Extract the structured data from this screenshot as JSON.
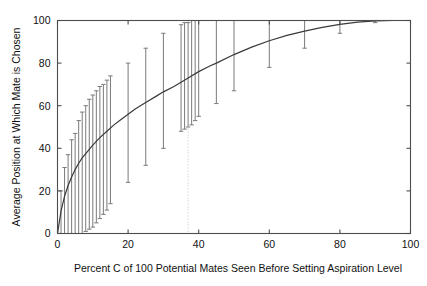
{
  "chart_data": {
    "type": "line",
    "title": "",
    "subtitle": "",
    "xlabel": "Percent C of 100 Potential Mates Seen Before Setting Aspiration Level",
    "ylabel": "Average Position at Which Mate is Chosen",
    "xlim": [
      0,
      100
    ],
    "ylim": [
      0,
      100
    ],
    "xticks": [
      0,
      20,
      40,
      60,
      80,
      100
    ],
    "yticks": [
      0,
      20,
      40,
      60,
      80,
      100
    ],
    "xtick_labels": [
      "0",
      "20",
      "40",
      "60",
      "80",
      "100"
    ],
    "ytick_labels": [
      "0",
      "20",
      "40",
      "60",
      "80",
      "100"
    ],
    "grid": false,
    "legend": null,
    "legend_position": "none",
    "frame": "box-all-sides-with-ticks",
    "annotations": [
      {
        "name": "optimal-aspiration-reference",
        "type": "vertical-dotted-line",
        "x": 37,
        "style": "dotted",
        "color": "#bdbdbd"
      }
    ],
    "series": [
      {
        "name": "mean-average-position",
        "style": "solid-curve",
        "color": "#3a3a3a",
        "x": [
          0,
          1,
          2,
          3,
          4,
          5,
          6,
          7,
          8,
          9,
          10,
          12,
          14,
          16,
          18,
          20,
          22,
          25,
          28,
          30,
          33,
          35,
          37,
          40,
          43,
          45,
          50,
          55,
          60,
          65,
          70,
          75,
          80,
          85,
          90,
          95,
          100
        ],
        "y": [
          0,
          10.5,
          17.5,
          22.5,
          26.5,
          30.0,
          33.0,
          35.5,
          37.5,
          39.5,
          41.5,
          45.0,
          48.0,
          51.0,
          53.5,
          56.0,
          58.5,
          61.5,
          64.5,
          66.5,
          69.0,
          71.0,
          73.0,
          76.0,
          78.5,
          80.0,
          84.0,
          87.5,
          90.5,
          93.0,
          95.0,
          96.8,
          98.2,
          99.2,
          99.8,
          100.0,
          100.0
        ]
      }
    ],
    "error_bars": {
      "name": "variability-range-bars",
      "color": "#7a7a7a",
      "orientation": "vertical",
      "caps": true,
      "points": [
        {
          "x": 1,
          "low": 0,
          "high": 20
        },
        {
          "x": 2,
          "low": 0,
          "high": 31
        },
        {
          "x": 3,
          "low": 0,
          "high": 37
        },
        {
          "x": 4,
          "low": 0,
          "high": 44
        },
        {
          "x": 5,
          "low": 0,
          "high": 47
        },
        {
          "x": 6,
          "low": 0,
          "high": 53
        },
        {
          "x": 7,
          "low": 0,
          "high": 57
        },
        {
          "x": 8,
          "low": 1,
          "high": 60
        },
        {
          "x": 9,
          "low": 2,
          "high": 63
        },
        {
          "x": 10,
          "low": 3,
          "high": 65
        },
        {
          "x": 11,
          "low": 5,
          "high": 67
        },
        {
          "x": 12,
          "low": 7,
          "high": 69
        },
        {
          "x": 13,
          "low": 9,
          "high": 70
        },
        {
          "x": 14,
          "low": 11,
          "high": 72
        },
        {
          "x": 15,
          "low": 14,
          "high": 74
        },
        {
          "x": 20,
          "low": 24,
          "high": 80
        },
        {
          "x": 25,
          "low": 32,
          "high": 87
        },
        {
          "x": 30,
          "low": 40,
          "high": 94
        },
        {
          "x": 35,
          "low": 48,
          "high": 98
        },
        {
          "x": 36,
          "low": 49,
          "high": 99
        },
        {
          "x": 37,
          "low": 50,
          "high": 99
        },
        {
          "x": 38,
          "low": 51,
          "high": 100
        },
        {
          "x": 39,
          "low": 53,
          "high": 100
        },
        {
          "x": 40,
          "low": 55,
          "high": 100
        },
        {
          "x": 45,
          "low": 61,
          "high": 100
        },
        {
          "x": 50,
          "low": 67,
          "high": 100
        },
        {
          "x": 60,
          "low": 78,
          "high": 100
        },
        {
          "x": 70,
          "low": 87,
          "high": 100
        },
        {
          "x": 80,
          "low": 94,
          "high": 100
        },
        {
          "x": 90,
          "low": 99,
          "high": 100
        }
      ]
    }
  }
}
